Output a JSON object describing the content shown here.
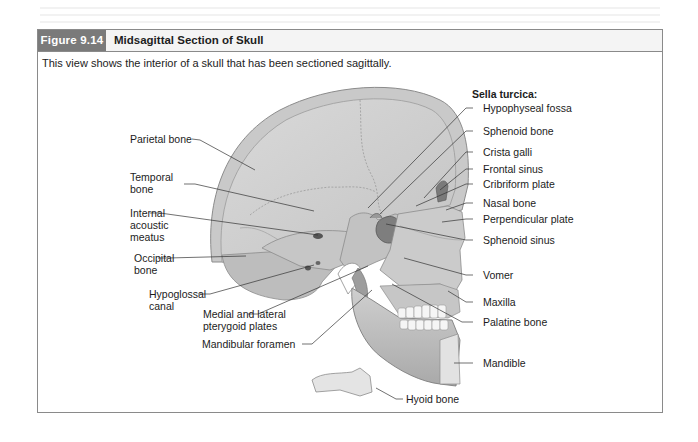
{
  "figure": {
    "number": "Figure 9.14",
    "title": "Midsagittal Section of Skull",
    "caption": "This view shows the interior of a skull that has been sectioned sagittally.",
    "colors": {
      "label_box": "#7a7a7a",
      "header_bg": "#f4f4f4",
      "frame_border": "#8a8a8a",
      "bone_fill": "#d4d4d4",
      "bone_dark": "#9a9a9a",
      "leader_line": "#333333"
    }
  },
  "labels": {
    "left": [
      {
        "id": "parietal",
        "text": "Parietal bone"
      },
      {
        "id": "temporal",
        "text": "Temporal bone"
      },
      {
        "id": "internal_acoustic",
        "text": "Internal acoustic meatus"
      },
      {
        "id": "occipital",
        "text": "Occipital bone"
      },
      {
        "id": "hypoglossal",
        "text": "Hypoglossal canal"
      },
      {
        "id": "pterygoid",
        "text": "Medial and lateral pterygoid plates"
      },
      {
        "id": "mandibular_foramen",
        "text": "Mandibular foramen"
      }
    ],
    "right_heading": "Sella turcica:",
    "right": [
      {
        "id": "hypophyseal",
        "text": "Hypophyseal fossa"
      },
      {
        "id": "sphenoid_bone",
        "text": "Sphenoid bone"
      },
      {
        "id": "crista_galli",
        "text": "Crista galli"
      },
      {
        "id": "frontal_sinus",
        "text": "Frontal sinus"
      },
      {
        "id": "cribriform",
        "text": "Cribriform plate"
      },
      {
        "id": "nasal_bone",
        "text": "Nasal bone"
      },
      {
        "id": "perpendicular",
        "text": "Perpendicular plate"
      },
      {
        "id": "sphenoid_sinus",
        "text": "Sphenoid sinus"
      },
      {
        "id": "vomer",
        "text": "Vomer"
      },
      {
        "id": "maxilla",
        "text": "Maxilla"
      },
      {
        "id": "palatine",
        "text": "Palatine bone"
      },
      {
        "id": "mandible",
        "text": "Mandible"
      }
    ],
    "bottom": [
      {
        "id": "hyoid",
        "text": "Hyoid bone"
      }
    ]
  }
}
